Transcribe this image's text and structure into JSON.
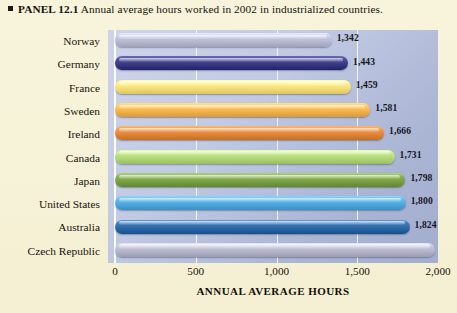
{
  "caption": {
    "bullet_icon": "square-bullet-icon",
    "panel_label": "PANEL 12.1",
    "text": "Annual average hours worked in 2002 in industrialized countries."
  },
  "chart_data": {
    "type": "bar",
    "orientation": "horizontal",
    "title": "Annual average hours worked in 2002 in industrialized countries.",
    "xlabel": "ANNUAL AVERAGE HOURS",
    "ylabel": "",
    "xlim": [
      0,
      2000
    ],
    "grid": true,
    "legend": "none",
    "xticks": [
      "0",
      "500",
      "1,000",
      "1,500",
      "2,000"
    ],
    "xtick_values": [
      0,
      500,
      1000,
      1500,
      2000
    ],
    "categories": [
      "Norway",
      "Germany",
      "France",
      "Sweden",
      "Ireland",
      "Canada",
      "Japan",
      "United States",
      "Australia",
      "Czech Republic"
    ],
    "values": [
      1342,
      1443,
      1459,
      1581,
      1666,
      1731,
      1798,
      1800,
      1824,
      1980
    ],
    "value_labels": [
      "1,342",
      "1,443",
      "1,459",
      "1,581",
      "1,666",
      "1,731",
      "1,798",
      "1,800",
      "1,824",
      "1,980"
    ],
    "bar_colors": [
      "#b9bcd2",
      "#3b3b86",
      "#f5e07a",
      "#f4b44e",
      "#e2883c",
      "#b4d97a",
      "#7ba346",
      "#53aadf",
      "#2f6aa8",
      "#b6b6cc"
    ],
    "plot_background": "#bcc5e0"
  },
  "colors": {
    "page_background": "#f6f2d8",
    "text": "#17130d",
    "gridline": "#ffffff"
  }
}
